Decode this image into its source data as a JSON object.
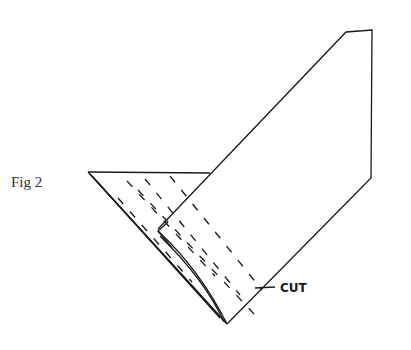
{
  "figure": {
    "label": "Fig 2",
    "annotation": "CUT",
    "line_color": "#1a1a1a"
  }
}
